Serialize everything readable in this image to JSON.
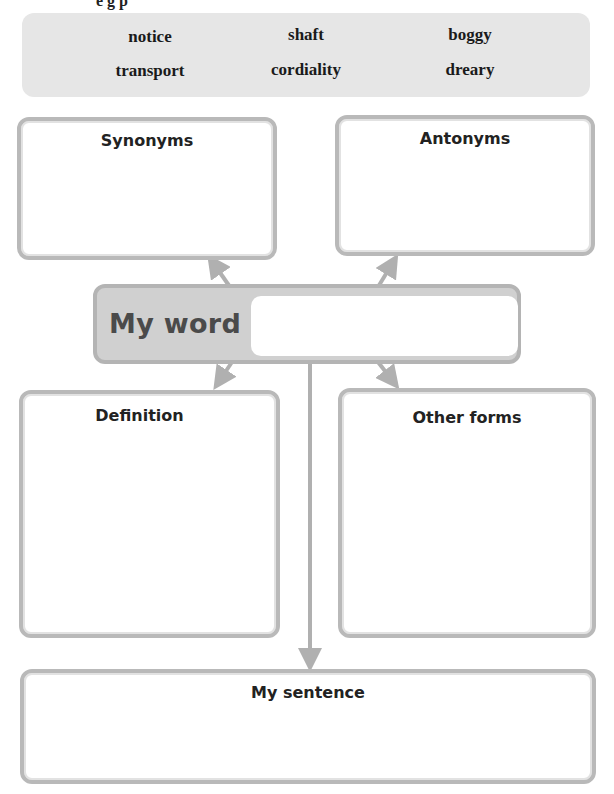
{
  "header_clip": "e  g  p",
  "word_bank": {
    "words": [
      "notice",
      "shaft",
      "boggy",
      "transport",
      "cordiality",
      "dreary"
    ]
  },
  "organizer": {
    "synonyms_label": "Synonyms",
    "antonyms_label": "Antonyms",
    "my_word_label": "My word",
    "my_word_value": "",
    "definition_label": "Definition",
    "other_forms_label": "Other forms",
    "my_sentence_label": "My sentence"
  },
  "colors": {
    "word_bank_bg": "#e6e6e6",
    "box_border": "#b9b9b9",
    "my_word_bg": "#d0d0d0",
    "arrow": "#b0b0b0"
  }
}
